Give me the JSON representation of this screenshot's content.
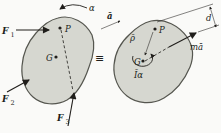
{
  "diagram": {
    "equivalence_symbol": "≡",
    "free_body": {
      "angular_accel": "α",
      "accel": "ā",
      "point": "P",
      "mass_center": "G",
      "forces": [
        {
          "base": "F",
          "sub": "1"
        },
        {
          "base": "F",
          "sub": "2"
        },
        {
          "base": "F",
          "sub": "3"
        }
      ]
    },
    "kinetic": {
      "point": "P",
      "mass_center": "G",
      "rho": "ρ̄",
      "inertia_couple": "Īα",
      "inertia_vector": "mā",
      "distance": "d"
    },
    "colors": {
      "body_fill": "#d6d7d0",
      "body_stroke": "#55564f",
      "ink": "#201e1b",
      "background": "#fafaf8"
    }
  }
}
